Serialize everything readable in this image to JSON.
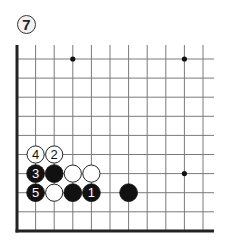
{
  "diagram": {
    "number_label": "7",
    "type": "go-board-corner",
    "colors": {
      "line": "#7a7a7a",
      "edge": "#222222",
      "black_stone": "#111111",
      "white_stone": "#ffffff",
      "star_point": "#111111"
    },
    "grid": {
      "columns": 11,
      "rows": 10,
      "x": [
        17,
        35.6,
        54.2,
        72.8,
        91.4,
        110,
        128.6,
        147.2,
        165.8,
        184.4,
        203
      ],
      "y": [
        59,
        78.1,
        97.2,
        116.3,
        135.4,
        154.5,
        173.6,
        192.7,
        211.8,
        231
      ],
      "left_edge": true,
      "bottom_edge": true
    },
    "star_points": [
      {
        "col": 3,
        "row": 0
      },
      {
        "col": 9,
        "row": 0
      },
      {
        "col": 9,
        "row": 6
      }
    ],
    "stones": [
      {
        "color": "white",
        "col": 1,
        "row": 5,
        "label": "4"
      },
      {
        "color": "white",
        "col": 2,
        "row": 5,
        "label": "2"
      },
      {
        "color": "black",
        "col": 1,
        "row": 6,
        "label": "3"
      },
      {
        "color": "black",
        "col": 2,
        "row": 6,
        "label": ""
      },
      {
        "color": "white",
        "col": 3,
        "row": 6,
        "label": ""
      },
      {
        "color": "white",
        "col": 4,
        "row": 6,
        "label": ""
      },
      {
        "color": "black",
        "col": 1,
        "row": 7,
        "label": "5"
      },
      {
        "color": "white",
        "col": 2,
        "row": 7,
        "label": ""
      },
      {
        "color": "black",
        "col": 3,
        "row": 7,
        "label": ""
      },
      {
        "color": "black",
        "col": 4,
        "row": 7,
        "label": "1"
      },
      {
        "color": "black",
        "col": 6,
        "row": 7,
        "label": ""
      }
    ]
  }
}
